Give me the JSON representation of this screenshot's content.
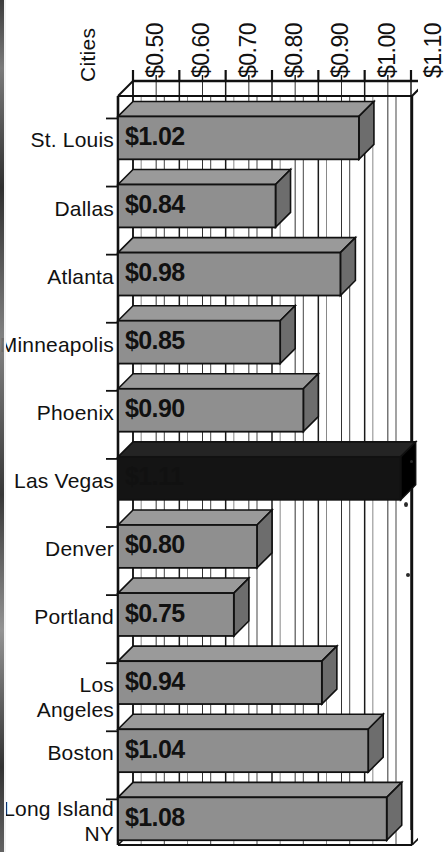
{
  "chart_data": {
    "type": "bar",
    "orientation": "horizontal",
    "style": "3d",
    "title": "",
    "xlabel": "",
    "ylabel": "Cities",
    "categories": [
      "St. Louis",
      "Dallas",
      "Atlanta",
      "Minneapolis",
      "Phoenix",
      "Las Vegas",
      "Denver",
      "Portland",
      "Los Angeles",
      "Boston",
      "Long Island\nNY"
    ],
    "values": [
      1.02,
      0.84,
      0.98,
      0.85,
      0.9,
      1.11,
      0.8,
      0.75,
      0.94,
      1.04,
      1.08
    ],
    "value_labels": [
      "$1.02",
      "$0.84",
      "$0.98",
      "$0.85",
      "$0.90",
      "$1.11",
      "$0.80",
      "$0.75",
      "$0.94",
      "$1.04",
      "$1.08"
    ],
    "highlighted_category": "Las Vegas",
    "highlight_color": "#141414",
    "bar_color": "#8f8f8f",
    "bar_top_color": "#9a9a9a",
    "bar_side_color": "#6d6d6d",
    "xlim": [
      0.5,
      1.1
    ],
    "xticks": [
      0.5,
      0.6,
      0.7,
      0.8,
      0.9,
      1.0,
      1.1
    ],
    "xtick_labels": [
      "$0.50",
      "$0.60",
      "$0.70",
      "$0.80",
      "$0.90",
      "$1.00",
      "$1.10"
    ],
    "minor_tick_step": 0.05,
    "axis_position": "top",
    "grid": true,
    "grid_orientation": "vertical",
    "legend": null
  },
  "axis": {
    "ylabel": "Cities"
  }
}
